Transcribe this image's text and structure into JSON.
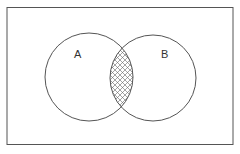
{
  "diagram": {
    "type": "venn",
    "sets": [
      {
        "label": "A"
      },
      {
        "label": "B"
      }
    ],
    "shaded_region": "A ∩ B",
    "colors": {
      "stroke": "#555555",
      "background": "#ffffff"
    }
  }
}
